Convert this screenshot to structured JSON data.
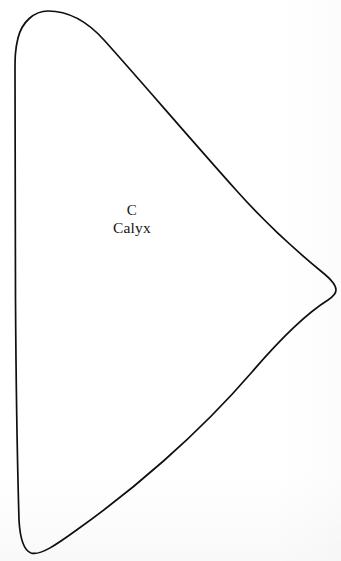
{
  "figure": {
    "panel_letter": "C",
    "structure_label": "Calyx",
    "background_color": "#ffffff",
    "outline_color": "#100f0f",
    "outline_width_px": 1.7,
    "canvas": {
      "width": 341,
      "height": 561
    },
    "shape": {
      "name": "calyx-outline",
      "description": "closed teardrop-wing outline, rounded apex top-left, near-vertical left margin, convex right lobe, tapered bottom tip",
      "apex_point": [
        48,
        11
      ],
      "leftmost_x": 15,
      "rightmost_point": [
        335,
        291
      ],
      "bottom_tip": [
        30,
        553
      ]
    }
  }
}
